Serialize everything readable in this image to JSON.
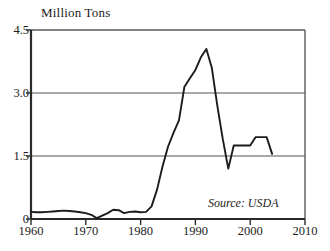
{
  "chart_data": {
    "type": "line",
    "title": "Million Tons",
    "xlabel": "",
    "ylabel": "Million Tons",
    "xlim": [
      1960,
      2010
    ],
    "ylim": [
      0,
      4.5
    ],
    "grid": true,
    "legend": "none",
    "annotation": "Source: USDA",
    "y_ticks": [
      {
        "value": 0,
        "label": "0"
      },
      {
        "value": 1.5,
        "label": "1.5"
      },
      {
        "value": 3.0,
        "label": "3.0"
      },
      {
        "value": 4.5,
        "label": "4.5"
      }
    ],
    "x_ticks": [
      {
        "value": 1960,
        "label": "1960"
      },
      {
        "value": 1970,
        "label": "1970"
      },
      {
        "value": 1980,
        "label": "1980"
      },
      {
        "value": 1990,
        "label": "1990"
      },
      {
        "value": 2000,
        "label": "2000"
      },
      {
        "value": 2010,
        "label": "2010"
      }
    ],
    "gridlines_y": [
      1.5,
      3.0
    ],
    "series": [
      {
        "name": "Production",
        "color": "#1c1c1c",
        "x": [
          1960,
          1961,
          1962,
          1963,
          1964,
          1965,
          1966,
          1967,
          1968,
          1969,
          1970,
          1971,
          1972,
          1973,
          1974,
          1975,
          1976,
          1977,
          1978,
          1979,
          1980,
          1981,
          1982,
          1983,
          1984,
          1985,
          1986,
          1987,
          1988,
          1989,
          1990,
          1991,
          1992,
          1993,
          1994,
          1995,
          1996,
          1997,
          1998,
          1999,
          2000,
          2001,
          2002,
          2003,
          2004
        ],
        "values": [
          0.17,
          0.16,
          0.16,
          0.17,
          0.18,
          0.19,
          0.2,
          0.19,
          0.18,
          0.16,
          0.14,
          0.1,
          0.02,
          0.08,
          0.14,
          0.22,
          0.21,
          0.14,
          0.17,
          0.18,
          0.16,
          0.17,
          0.3,
          0.7,
          1.25,
          1.72,
          2.05,
          2.35,
          3.15,
          3.35,
          3.55,
          3.85,
          4.05,
          3.6,
          2.7,
          1.9,
          1.2,
          1.75,
          1.75,
          1.75,
          1.75,
          1.95,
          1.95,
          1.95,
          1.55
        ]
      }
    ]
  }
}
